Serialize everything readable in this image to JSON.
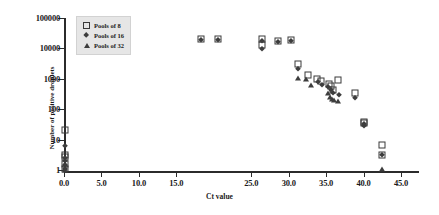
{
  "chart_data": {
    "type": "scatter",
    "title": "",
    "xlabel": "Ct value",
    "ylabel": "Number of positive droplets",
    "xlim": [
      0,
      47
    ],
    "ylim": [
      1,
      100000
    ],
    "yscale": "log",
    "grid": false,
    "legend_position": "top-left",
    "xticks": [
      "0.0",
      "5.0",
      "10.0",
      "15.0",
      "25.0",
      "30.0",
      "35.0",
      "40.0",
      "45.0"
    ],
    "xtick_values": [
      0,
      5,
      10,
      15,
      25,
      30,
      35,
      40,
      45
    ],
    "yticks": [
      "1",
      "10",
      "100",
      "1000",
      "10000",
      "100000"
    ],
    "ytick_values": [
      1,
      10,
      100,
      1000,
      10000,
      100000
    ],
    "series": [
      {
        "name": "Pools of 8",
        "marker": "open-square",
        "color": "#3a3a3a",
        "points": [
          [
            0.2,
            20
          ],
          [
            0.2,
            3.2
          ],
          [
            0.2,
            2.6
          ],
          [
            0.2,
            1.6
          ],
          [
            0.2,
            1.1
          ],
          [
            18.3,
            21000
          ],
          [
            20.5,
            20000
          ],
          [
            26.4,
            20000
          ],
          [
            26.4,
            13000
          ],
          [
            28.6,
            18000
          ],
          [
            30.3,
            19000
          ],
          [
            31.2,
            3100
          ],
          [
            32.6,
            1350
          ],
          [
            33.8,
            1000
          ],
          [
            34.3,
            820
          ],
          [
            35.4,
            700
          ],
          [
            35.6,
            560
          ],
          [
            35.9,
            420
          ],
          [
            36.6,
            900
          ],
          [
            38.9,
            330
          ],
          [
            40.0,
            38
          ],
          [
            40.1,
            36
          ],
          [
            42.4,
            6.5
          ],
          [
            42.4,
            3.0
          ]
        ]
      },
      {
        "name": "Pools of 16",
        "marker": "filled-diamond",
        "color": "#3d3d3d",
        "points": [
          [
            0.2,
            6.0
          ],
          [
            0.2,
            2.4
          ],
          [
            0.2,
            2.0
          ],
          [
            0.2,
            1.5
          ],
          [
            0.2,
            1.05
          ],
          [
            18.3,
            19500
          ],
          [
            20.5,
            18500
          ],
          [
            26.4,
            17000
          ],
          [
            26.4,
            9500
          ],
          [
            28.6,
            16500
          ],
          [
            30.3,
            17500
          ],
          [
            31.2,
            2100
          ],
          [
            33.9,
            760
          ],
          [
            34.4,
            640
          ],
          [
            35.3,
            520
          ],
          [
            35.6,
            430
          ],
          [
            35.9,
            350
          ],
          [
            36.7,
            300
          ],
          [
            38.9,
            230
          ],
          [
            40.0,
            33
          ],
          [
            40.1,
            27
          ],
          [
            42.4,
            3.0
          ]
        ]
      },
      {
        "name": "Pools of 32",
        "marker": "filled-triangle",
        "color": "#3d3d3d",
        "points": [
          [
            0.2,
            1.6
          ],
          [
            0.2,
            1.2
          ],
          [
            0.2,
            1.0
          ],
          [
            31.2,
            1050
          ],
          [
            32.3,
            950
          ],
          [
            33.0,
            620
          ],
          [
            35.3,
            330
          ],
          [
            35.5,
            260
          ],
          [
            35.8,
            215
          ],
          [
            36.0,
            200
          ],
          [
            36.6,
            190
          ],
          [
            42.4,
            1.05
          ]
        ]
      }
    ]
  },
  "legend": {
    "items": [
      {
        "label": "Pools of 8"
      },
      {
        "label": "Pools of 16"
      },
      {
        "label": "Pools of 32"
      }
    ]
  }
}
